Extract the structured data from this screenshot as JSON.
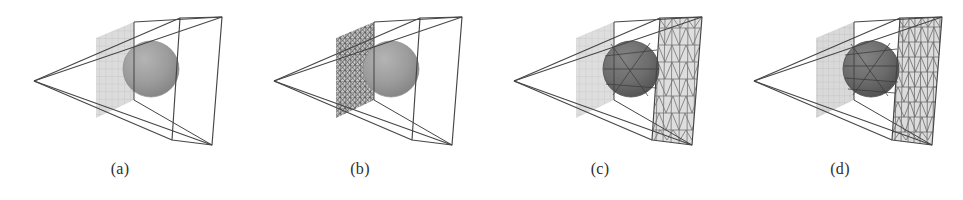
{
  "figure": {
    "kind": "scientific-figure",
    "subfigure_count": 4,
    "background_color": "#ffffff",
    "description_visible_text_only": true
  },
  "colors": {
    "background": "#ffffff",
    "wireframe_line": "#4a4a4a",
    "wireframe_line_dark": "#333333",
    "near_plane_fill": "#d8d8d8",
    "near_plane_grid": "#b9b9b9",
    "dense_plane_fill": "#c9c9c9",
    "dense_plane_mesh": "#5d5d5d",
    "far_plane_fill": "#dcdcdc",
    "far_plane_mesh": "#6f6f6f",
    "sphere_light": "#9c9c9c",
    "sphere_light_edge": "#8a8a8a",
    "sphere_dark": "#6d6d6d",
    "sphere_dark_edge": "#4f4f4f",
    "caption_text": "#2e2e2e"
  },
  "panels": [
    {
      "id": "panel-a",
      "caption": "(a)",
      "x_offset": 0,
      "near_plane_style": "coarse-grid",
      "near_plane_grid_cols": 8,
      "near_plane_grid_rows": 11,
      "far_plane_style": "none",
      "sphere_shade": "light",
      "sphere_mesh_overlay": false
    },
    {
      "id": "panel-b",
      "caption": "(b)",
      "x_offset": 240,
      "near_plane_style": "dense-triangulated",
      "near_plane_grid_cols": 10,
      "near_plane_grid_rows": 14,
      "far_plane_style": "none",
      "sphere_shade": "light",
      "sphere_mesh_overlay": false
    },
    {
      "id": "panel-c",
      "caption": "(c)",
      "x_offset": 480,
      "near_plane_style": "coarse-grid",
      "near_plane_grid_cols": 8,
      "near_plane_grid_rows": 11,
      "far_plane_style": "triangle-strips-coarse",
      "far_plane_strip_rows": 7,
      "far_plane_strip_cols": 6,
      "sphere_shade": "dark",
      "sphere_mesh_overlay": true
    },
    {
      "id": "panel-d",
      "caption": "(d)",
      "x_offset": 720,
      "near_plane_style": "coarse-grid",
      "near_plane_grid_cols": 9,
      "near_plane_grid_rows": 12,
      "far_plane_style": "triangle-strips-fine",
      "far_plane_strip_rows": 8,
      "far_plane_strip_cols": 8,
      "sphere_shade": "dark",
      "sphere_mesh_overlay": true
    }
  ],
  "geometry": {
    "apex": [
      34,
      81
    ],
    "near_plane_quad": [
      [
        96,
        38
      ],
      [
        134,
        22
      ],
      [
        134,
        100
      ],
      [
        96,
        118
      ]
    ],
    "far_plane_quad": [
      [
        180,
        18
      ],
      [
        222,
        17
      ],
      [
        212,
        145
      ],
      [
        172,
        140
      ]
    ],
    "frustum_top_rear": [
      [
        134,
        22
      ],
      [
        222,
        17
      ]
    ],
    "sphere_center": [
      151,
      69
    ],
    "sphere_radius": 28
  }
}
